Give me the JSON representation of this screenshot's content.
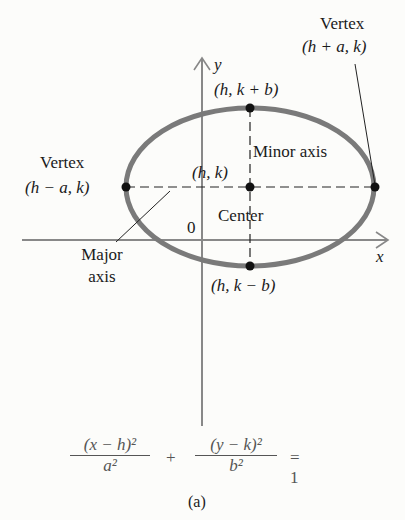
{
  "figure": {
    "caption": "(a)",
    "axes": {
      "x_label": "x",
      "y_label": "y",
      "origin_label": "0"
    },
    "ellipse": {
      "stroke_color": "#7a7a7a",
      "point_color": "#111111"
    },
    "labels": {
      "vertex_right_title": "Vertex",
      "vertex_right_coords": "(h + a, k)",
      "vertex_left_title": "Vertex",
      "vertex_left_coords": "(h − a, k)",
      "top_point": "(h, k + b)",
      "bottom_point": "(h, k − b)",
      "center_point": "(h, k)",
      "center_label": "Center",
      "minor_axis": "Minor axis",
      "major_axis_line1": "Major",
      "major_axis_line2": "axis"
    },
    "equation": {
      "term1_num": "(x − h)²",
      "term1_den": "a²",
      "plus": "+",
      "term2_num": "(y − k)²",
      "term2_den": "b²",
      "rhs": "= 1"
    }
  }
}
